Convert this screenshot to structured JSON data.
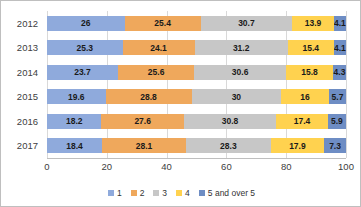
{
  "chart_data": {
    "type": "bar",
    "orientation": "horizontal",
    "stacked": true,
    "stack_mode": "percent",
    "title": "",
    "xlabel": "",
    "ylabel": "",
    "xlim": [
      0,
      100
    ],
    "xticks": [
      0,
      20,
      40,
      60,
      80,
      100
    ],
    "grid": true,
    "legend_position": "bottom",
    "categories": [
      "2012",
      "2013",
      "2014",
      "2015",
      "2016",
      "2017"
    ],
    "series": [
      {
        "name": "1",
        "color": "#8FAADC",
        "values": [
          26,
          25.3,
          23.7,
          19.6,
          18.2,
          18.4
        ],
        "labels": [
          "26",
          "25.3",
          "23.7",
          "19.6",
          "18.2",
          "18.4"
        ]
      },
      {
        "name": "2",
        "color": "#EFA85C",
        "values": [
          25.4,
          24.1,
          25.6,
          28.8,
          27.6,
          28.1
        ],
        "labels": [
          "25.4",
          "24.1",
          "25.6",
          "28.8",
          "27.6",
          "28.1"
        ]
      },
      {
        "name": "3",
        "color": "#C7C7C7",
        "values": [
          30.7,
          31.2,
          30.6,
          30,
          30.8,
          28.3
        ],
        "labels": [
          "30.7",
          "31.2",
          "30.6",
          "30",
          "30.8",
          "28.3"
        ]
      },
      {
        "name": "4",
        "color": "#FFD24F",
        "values": [
          13.9,
          15.4,
          15.8,
          16,
          17.4,
          17.9
        ],
        "labels": [
          "13.9",
          "15.4",
          "15.8",
          "16",
          "17.4",
          "17.9"
        ]
      },
      {
        "name": "5 and over 5",
        "color": "#6E8DC4",
        "values": [
          4.1,
          4.1,
          4.3,
          5.7,
          5.9,
          7.3
        ],
        "labels": [
          "4.1",
          "4.1",
          "4.3",
          "5.7",
          "5.9",
          "7.3"
        ]
      }
    ]
  },
  "colors": {
    "series_1": "#8FAADC",
    "series_2": "#EFA85C",
    "series_3": "#C7C7C7",
    "series_4": "#FFD24F",
    "series_5": "#6E8DC4",
    "gridline": "#D9D9D9",
    "axis": "#BFBFBF",
    "border": "#BFBFBF",
    "text": "#404040"
  }
}
